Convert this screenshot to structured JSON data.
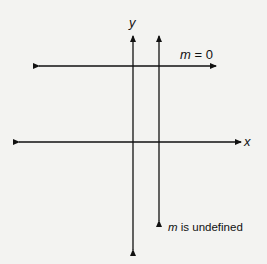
{
  "diagram": {
    "axis_labels": {
      "x": "x",
      "y": "y"
    },
    "horizontal_line_label": {
      "var": "m",
      "rest": " = 0"
    },
    "vertical_line_label": {
      "var": "m",
      "rest": " is undefined"
    },
    "colors": {
      "background": "#f3f3f1",
      "line": "#111111"
    }
  }
}
